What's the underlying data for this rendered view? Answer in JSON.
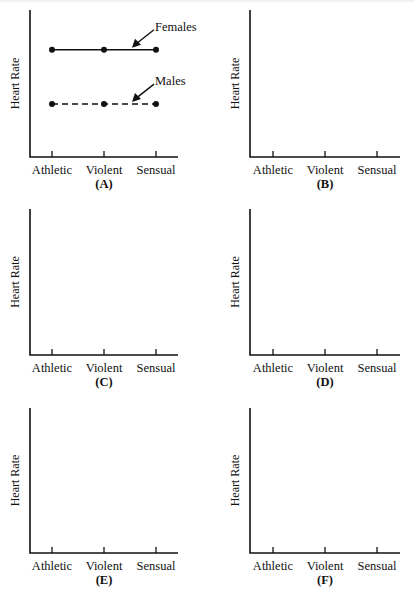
{
  "chart_data": [
    {
      "type": "line",
      "panel_label": "(A)",
      "ylabel": "Heart Rate",
      "xlabel": "",
      "categories": [
        "Athletic",
        "Violent",
        "Sensual"
      ],
      "ylim": [
        0,
        10
      ],
      "yticks": false,
      "grid": false,
      "series": [
        {
          "name": "Females",
          "values": [
            7.3,
            7.3,
            7.3
          ],
          "style": "solid",
          "marker": "circle",
          "color": "#111111",
          "annotation": "Females"
        },
        {
          "name": "Males",
          "values": [
            3.6,
            3.6,
            3.6
          ],
          "style": "dashed",
          "marker": "circle",
          "color": "#111111",
          "annotation": "Males"
        }
      ],
      "legend": "arrow-annotations"
    },
    {
      "type": "line",
      "panel_label": "(B)",
      "ylabel": "Heart Rate",
      "xlabel": "",
      "categories": [
        "Athletic",
        "Violent",
        "Sensual"
      ],
      "ylim": [
        0,
        10
      ],
      "yticks": false,
      "grid": false,
      "series": []
    },
    {
      "type": "line",
      "panel_label": "(C)",
      "ylabel": "Heart Rate",
      "xlabel": "",
      "categories": [
        "Athletic",
        "Violent",
        "Sensual"
      ],
      "ylim": [
        0,
        10
      ],
      "yticks": false,
      "grid": false,
      "series": []
    },
    {
      "type": "line",
      "panel_label": "(D)",
      "ylabel": "Heart Rate",
      "xlabel": "",
      "categories": [
        "Athletic",
        "Violent",
        "Sensual"
      ],
      "ylim": [
        0,
        10
      ],
      "yticks": false,
      "grid": false,
      "series": []
    },
    {
      "type": "line",
      "panel_label": "(E)",
      "ylabel": "Heart Rate",
      "xlabel": "",
      "categories": [
        "Athletic",
        "Violent",
        "Sensual"
      ],
      "ylim": [
        0,
        10
      ],
      "yticks": false,
      "grid": false,
      "series": []
    },
    {
      "type": "line",
      "panel_label": "(F)",
      "ylabel": "Heart Rate",
      "xlabel": "",
      "categories": [
        "Athletic",
        "Violent",
        "Sensual"
      ],
      "ylim": [
        0,
        10
      ],
      "yticks": false,
      "grid": false,
      "series": []
    }
  ]
}
